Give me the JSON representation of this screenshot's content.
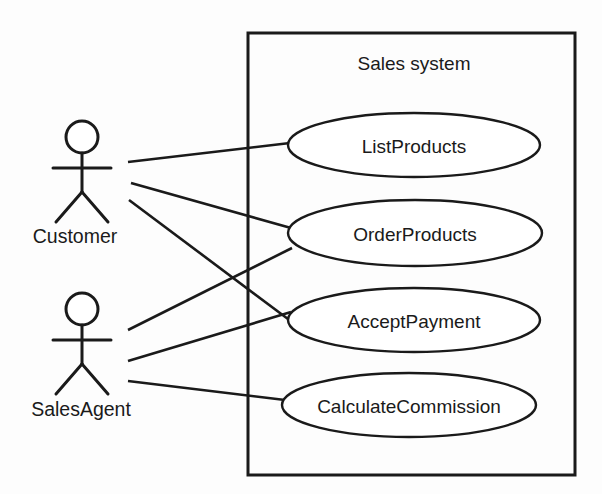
{
  "diagram": {
    "kind": "uml-use-case-diagram",
    "canvas": {
      "width": 602,
      "height": 494,
      "background": "#fdfdfd"
    },
    "stroke_color": "#1a1a1a",
    "fill_color": "#ffffff"
  },
  "boundary": {
    "label": "Sales system",
    "x": 248,
    "y": 33,
    "width": 327,
    "height": 442,
    "label_x": 414,
    "label_y": 70
  },
  "actors": [
    {
      "id": "customer",
      "label": "Customer",
      "head_cx": 82,
      "head_cy": 137,
      "head_r": 16,
      "body_top": 153,
      "body_bottom": 192,
      "arm_y": 168,
      "arm_left": 53,
      "arm_right": 111,
      "leg_left_x": 56,
      "leg_right_x": 108,
      "leg_bottom": 222,
      "label_x": 75,
      "label_y": 243
    },
    {
      "id": "salesagent",
      "label": "SalesAgent",
      "head_cx": 82,
      "head_cy": 309,
      "head_r": 16,
      "body_top": 325,
      "body_bottom": 364,
      "arm_y": 340,
      "arm_left": 53,
      "arm_right": 111,
      "leg_left_x": 56,
      "leg_right_x": 108,
      "leg_bottom": 394,
      "label_x": 81,
      "label_y": 416
    }
  ],
  "use_cases": [
    {
      "id": "listproducts",
      "label": "ListProducts",
      "cx": 414,
      "cy": 145,
      "rx": 126,
      "ry": 32
    },
    {
      "id": "orderproducts",
      "label": "OrderProducts",
      "cx": 415,
      "cy": 233,
      "rx": 127,
      "ry": 33
    },
    {
      "id": "acceptpayment",
      "label": "AcceptPayment",
      "cx": 414,
      "cy": 320,
      "rx": 126,
      "ry": 32
    },
    {
      "id": "calculatecommission",
      "label": "CalculateCommission",
      "cx": 409,
      "cy": 405,
      "rx": 127,
      "ry": 32
    }
  ],
  "associations": [
    {
      "id": "customer-listproducts",
      "from": "customer",
      "to": "listproducts",
      "x1": 128,
      "y1": 162,
      "x2": 290,
      "y2": 143
    },
    {
      "id": "customer-orderproducts",
      "from": "customer",
      "to": "orderproducts",
      "x1": 131,
      "y1": 183,
      "x2": 291,
      "y2": 228
    },
    {
      "id": "customer-acceptpayment",
      "from": "customer",
      "to": "acceptpayment",
      "x1": 129,
      "y1": 200,
      "x2": 292,
      "y2": 322
    },
    {
      "id": "salesagent-orderproducts",
      "from": "salesagent",
      "to": "orderproducts",
      "x1": 128,
      "y1": 330,
      "x2": 292,
      "y2": 248
    },
    {
      "id": "salesagent-acceptpayment",
      "from": "salesagent",
      "to": "acceptpayment",
      "x1": 128,
      "y1": 361,
      "x2": 291,
      "y2": 312
    },
    {
      "id": "salesagent-calculatecommission",
      "from": "salesagent",
      "to": "calculatecommission",
      "x1": 128,
      "y1": 381,
      "x2": 285,
      "y2": 400
    }
  ]
}
